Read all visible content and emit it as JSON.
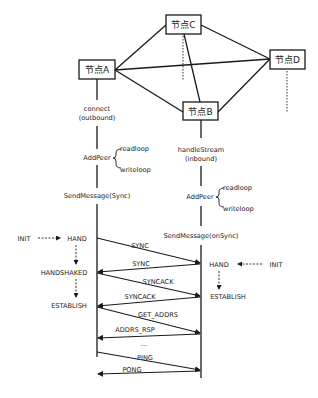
{
  "nodes": {
    "a": "节点A",
    "b": "节点B",
    "c": "节点C",
    "d": "节点D"
  },
  "left": {
    "connect": "connect",
    "outbound": "(outbound)",
    "addpeer": "AddPeer",
    "readloop": "readloop",
    "writeloop": "writeloop",
    "sendmessage": "SendMessage(Sync)",
    "init": "INIT",
    "states": [
      "HAND",
      "HANDSHAKED",
      "ESTABLISH"
    ]
  },
  "right": {
    "handlestream": "handleStream",
    "inbound": "(inbound)",
    "addpeer": "AddPeer",
    "readloop": "readloop",
    "writeloop": "writeloop",
    "sendmessage": "SendMessage(onSync)",
    "init": "INIT",
    "states": [
      "HAND",
      "ESTABLISH"
    ]
  },
  "messages": [
    {
      "label": "SYNC",
      "direction": "A→B"
    },
    {
      "label": "SYNC",
      "direction": "B→A"
    },
    {
      "label": "SYNCACK",
      "direction": "A→B"
    },
    {
      "label": "SYNCACK",
      "direction": "B→A"
    },
    {
      "label": "GET_ADDRS",
      "direction": "A→B"
    },
    {
      "label": "ADDRS_RSP",
      "direction": "B→A"
    },
    {
      "label": "...",
      "direction": ""
    },
    {
      "label": "PING",
      "direction": "A→B"
    },
    {
      "label": "PONG",
      "direction": "B→A"
    }
  ],
  "colors": {
    "line": "#1a1a1a",
    "text": "#222222",
    "background": "#ffffff"
  }
}
